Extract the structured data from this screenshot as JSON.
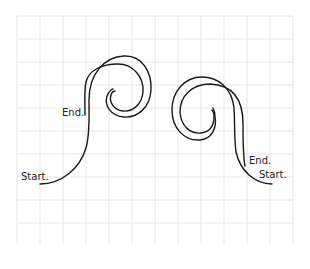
{
  "diagram": {
    "grid": {
      "x0": 17,
      "y0": 16,
      "x1": 294,
      "y1": 244,
      "spacing": 23,
      "color": "#e6e6e6"
    },
    "stroke_color": "#1a1a1a",
    "shapes": [
      {
        "id": "left-spiral",
        "paths": {
          "start_line": "M40,184 C62,184 80,168 86,148 C90,134 89,118 89,100 C89,74 104,57 124,56 C142,55 152,72 151,90 C150,108 137,118 124,117 C111,116 104,106 107,96 C109,91 112,89 113,89",
          "end_line": "M85,115 C85,104 84,92 86,82 C89,70 102,64 118,64 C134,64 144,78 143,92 C142,104 133,112 123,111 C113,110 109,101 111,95 C112,92 114,91 115,91"
        },
        "labels": [
          {
            "text": "Start.",
            "x": 21,
            "y": 180
          },
          {
            "text": "End.",
            "x": 62,
            "y": 116
          }
        ]
      },
      {
        "id": "right-spiral",
        "paths": {
          "start_line": "M272,184 C254,184 240,170 236,152 C234,138 235,122 234,108 C232,88 218,77 202,77 C184,77 172,92 172,110 C172,128 184,141 200,140 C212,139 217,128 215,116 C215,113 214,110 213,108",
          "end_line": "M245,166 C243,156 243,140 243,124 C243,104 236,85 210,84 C192,84 180,96 180,112 C181,126 190,134 201,133 C211,132 214,124 214,116 C214,113 213,111 212,110"
        },
        "labels": [
          {
            "text": "End.",
            "x": 249,
            "y": 164
          },
          {
            "text": "Start.",
            "x": 259,
            "y": 178
          }
        ]
      }
    ]
  }
}
